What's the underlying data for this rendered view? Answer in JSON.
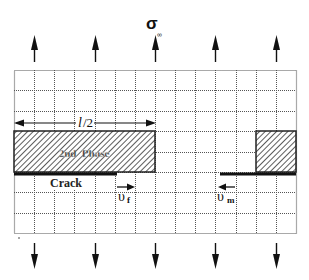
{
  "title": {
    "symbol": "σ",
    "subscript": "∞"
  },
  "grid": {
    "columns": 14,
    "rows": 8
  },
  "load_arrows": {
    "count": 5,
    "top_direction": "up",
    "bottom_direction": "down"
  },
  "dimension": {
    "label_main": "l",
    "label_rest": "/2"
  },
  "second_phase": {
    "label": "2nd  Phase"
  },
  "crack": {
    "label": "Crack"
  },
  "velocities": {
    "fiber": {
      "symbol": "υ",
      "subscript": "f",
      "direction": "right"
    },
    "matrix": {
      "symbol": "υ",
      "subscript": "m",
      "direction": "left"
    }
  },
  "colors": {
    "line": "#111111",
    "grid": "#555555",
    "hatch": "#333333",
    "background": "#ffffff"
  }
}
